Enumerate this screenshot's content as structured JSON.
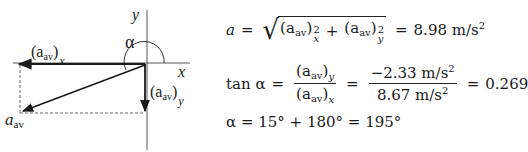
{
  "diagram": {
    "axis_x_label": "x",
    "axis_y_label": "y",
    "angle_label": "α",
    "component_x": {
      "base": "(a",
      "sub": "av",
      "close": ")",
      "index": "x"
    },
    "component_y": {
      "base": "(a",
      "sub": "av",
      "close": ")",
      "index": "y"
    },
    "resultant": {
      "base": "a",
      "sub": "av"
    },
    "colors": {
      "axis": "#444444",
      "vector": "#1a1a1a",
      "dashed": "#666666",
      "arc": "#333333"
    }
  },
  "equations": {
    "magnitude": {
      "lhs": "a",
      "eq": "=",
      "term1": {
        "base": "(a",
        "sub": "av",
        "close": ")",
        "exp": "2",
        "index": "x"
      },
      "plus": "+",
      "term2": {
        "base": "(a",
        "sub": "av",
        "close": ")",
        "exp": "2",
        "index": "y"
      },
      "eq2": "=",
      "result": "8.98 m/s",
      "result_exp": "2"
    },
    "tangent": {
      "lhs": "tan α",
      "eq": "=",
      "frac1_num": {
        "base": "(a",
        "sub": "av",
        "close": ")",
        "index": "y"
      },
      "frac1_den": {
        "base": "(a",
        "sub": "av",
        "close": ")",
        "index": "x"
      },
      "eq2": "=",
      "frac2_num": "−2.33 m/s",
      "frac2_num_exp": "2",
      "frac2_den": "8.67 m/s",
      "frac2_den_exp": "2",
      "eq3": "=",
      "result": "0.269"
    },
    "angle": {
      "text": "α = 15° + 180° = 195°"
    }
  }
}
